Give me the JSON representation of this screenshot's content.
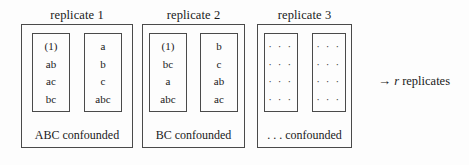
{
  "figure": {
    "annotation": {
      "arrow": "→",
      "symbol": "r",
      "text": "replicates"
    }
  },
  "replicates": [
    {
      "title": "replicate 1",
      "caption": "ABC confounded",
      "blocks": [
        {
          "cells": [
            "(1)",
            "ab",
            "ac",
            "bc"
          ]
        },
        {
          "cells": [
            "a",
            "b",
            "c",
            "abc"
          ]
        }
      ]
    },
    {
      "title": "replicate 2",
      "caption": "BC confounded",
      "blocks": [
        {
          "cells": [
            "(1)",
            "bc",
            "a",
            "abc"
          ]
        },
        {
          "cells": [
            "b",
            "c",
            "ab",
            "ac"
          ]
        }
      ]
    },
    {
      "title": "replicate 3",
      "caption": ". . . confounded",
      "blocks": [
        {
          "cells": [
            "· · ·",
            "· · ·",
            "· · ·",
            "· · ·"
          ]
        },
        {
          "cells": [
            "· · ·",
            "· · ·",
            "· · ·",
            "· · ·"
          ]
        }
      ]
    }
  ]
}
